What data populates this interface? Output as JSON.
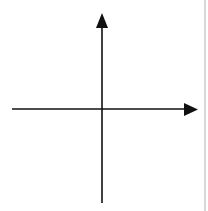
{
  "diagram": {
    "type": "coordinate-grid",
    "axes": {
      "x_label": "x",
      "y_label": "y",
      "x_range": [
        -5,
        5
      ],
      "y_range": [
        -5,
        5
      ]
    },
    "grid": {
      "origin_px": [
        102,
        109
      ],
      "x_lines_px": [
        23,
        39,
        55,
        71,
        87,
        102,
        118,
        134,
        150,
        166,
        182
      ],
      "y_lines_px": [
        28,
        44,
        60,
        76,
        92,
        109,
        126,
        142,
        159,
        175,
        191
      ],
      "line_color": "#555555",
      "axis_color": "#111111"
    },
    "points": [
      {
        "label": "D",
        "x": -1,
        "y": 5,
        "px": [
          87,
          27
        ],
        "label_px": [
          73,
          33
        ]
      },
      {
        "label": "C",
        "x": 5,
        "y": 3,
        "px": [
          182,
          60
        ],
        "label_px": [
          168,
          70
        ]
      },
      {
        "label": "G",
        "x": -5,
        "y": 0,
        "px": [
          23,
          109
        ],
        "label_px": [
          26,
          103
        ]
      },
      {
        "label": "E",
        "x": -3,
        "y": -1,
        "px": [
          55,
          125
        ],
        "label_px": [
          42,
          137
        ]
      },
      {
        "label": "F",
        "x": 4,
        "y": -2,
        "px": [
          166,
          141
        ],
        "label_px": [
          153,
          153
        ]
      },
      {
        "label": "H",
        "x": 0,
        "y": -4,
        "px": [
          102,
          175
        ],
        "label_px": [
          90,
          188
        ]
      },
      {
        "label": "I",
        "x": -5,
        "y": -5,
        "px": [
          23,
          191
        ],
        "label_px": [
          29,
          186
        ]
      }
    ]
  }
}
